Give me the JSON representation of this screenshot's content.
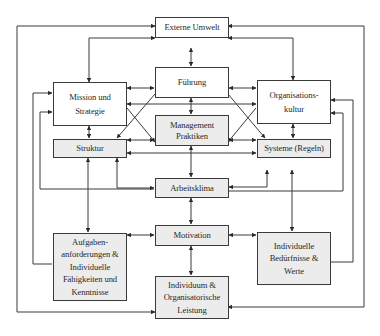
{
  "diagram": {
    "type": "organizational-performance-model",
    "colors": {
      "line": "#3a3a3a",
      "box_fill_white": "#ffffff",
      "box_fill_grey": "#ececec",
      "text": "#2a2a2a"
    },
    "nodes": {
      "externe_umwelt": {
        "label": "Externe Umwelt"
      },
      "fuehrung": {
        "label": "Führung"
      },
      "mission": {
        "label": "Mission und\nStrategie"
      },
      "kultur": {
        "label": "Organisations-\nkultur"
      },
      "management": {
        "label": "Management\nPraktiken"
      },
      "struktur": {
        "label": "Struktur"
      },
      "systeme": {
        "label": "Systeme (Regeln)"
      },
      "arbeitsklima": {
        "label": "Arbeitsklima"
      },
      "motivation": {
        "label": "Motivation"
      },
      "aufgaben": {
        "label": "Aufgaben-\nanforderungen &\nIndividuelle\nFähigkeiten und\nKenntnisse"
      },
      "beduerfnisse": {
        "label": "Individuelle\nBedürfnisse &\nWerte"
      },
      "leistung": {
        "label": "Individuum &\nOrganisatorische\nLeistung"
      }
    },
    "edges": [
      [
        "externe_umwelt",
        "mission"
      ],
      [
        "externe_umwelt",
        "kultur"
      ],
      [
        "externe_umwelt",
        "fuehrung"
      ],
      [
        "externe_umwelt",
        "leistung"
      ],
      [
        "fuehrung",
        "mission"
      ],
      [
        "fuehrung",
        "kultur"
      ],
      [
        "fuehrung",
        "management"
      ],
      [
        "fuehrung",
        "struktur"
      ],
      [
        "fuehrung",
        "systeme"
      ],
      [
        "mission",
        "struktur"
      ],
      [
        "mission",
        "management"
      ],
      [
        "kultur",
        "systeme"
      ],
      [
        "kultur",
        "management"
      ],
      [
        "struktur",
        "management"
      ],
      [
        "struktur",
        "systeme"
      ],
      [
        "systeme",
        "management"
      ],
      [
        "management",
        "arbeitsklima"
      ],
      [
        "struktur",
        "arbeitsklima"
      ],
      [
        "systeme",
        "arbeitsklima"
      ],
      [
        "struktur",
        "aufgaben"
      ],
      [
        "kultur",
        "beduerfnisse"
      ],
      [
        "arbeitsklima",
        "motivation"
      ],
      [
        "motivation",
        "aufgaben"
      ],
      [
        "motivation",
        "beduerfnisse"
      ],
      [
        "motivation",
        "leistung"
      ],
      [
        "leistung",
        "mission"
      ],
      [
        "leistung",
        "kultur"
      ],
      [
        "aufgaben",
        "mission"
      ],
      [
        "beduerfnisse",
        "kultur"
      ]
    ]
  }
}
